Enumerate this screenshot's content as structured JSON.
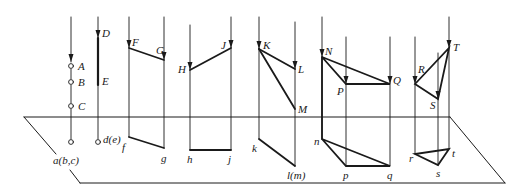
{
  "figure": {
    "colors": {
      "line": "#1a1a1a",
      "background": "#ffffff"
    }
  },
  "plane": {
    "points": [
      [
        24,
        117
      ],
      [
        450,
        117
      ],
      [
        505,
        183
      ],
      [
        80,
        183
      ]
    ]
  },
  "labels": {
    "A": "A",
    "B": "B",
    "C": "C",
    "D": "D",
    "E": "E",
    "F": "F",
    "G": "G",
    "H": "H",
    "J": "J",
    "K": "K",
    "L": "L",
    "M": "M",
    "N": "N",
    "P": "P",
    "Q": "Q",
    "R": "R",
    "S": "S",
    "T": "T",
    "abc": "a(b,c)",
    "de": "d(e)",
    "f": "f",
    "g": "g",
    "h": "h",
    "j": "j",
    "k": "k",
    "lm": "l(m)",
    "n": "n",
    "p": "p",
    "q": "q",
    "r": "r",
    "s": "s",
    "t": "t"
  },
  "groups": [
    {
      "name": "points-ABC",
      "space": [
        "A",
        "B",
        "C"
      ],
      "projection": "a(b,c)"
    },
    {
      "name": "line-DE",
      "space": [
        "D",
        "E"
      ],
      "projection": "d(e)"
    },
    {
      "name": "line-FG",
      "space": [
        "F",
        "G"
      ],
      "projection": "fg"
    },
    {
      "name": "line-HJ",
      "space": [
        "H",
        "J"
      ],
      "projection": "hj"
    },
    {
      "name": "lines-KLM",
      "space": [
        "K",
        "L",
        "M"
      ],
      "projection": "k l(m)"
    },
    {
      "name": "plane-NPQ",
      "space": [
        "N",
        "P",
        "Q"
      ],
      "projection": "npq"
    },
    {
      "name": "plane-RST",
      "space": [
        "R",
        "S",
        "T"
      ],
      "projection": "rst"
    }
  ]
}
